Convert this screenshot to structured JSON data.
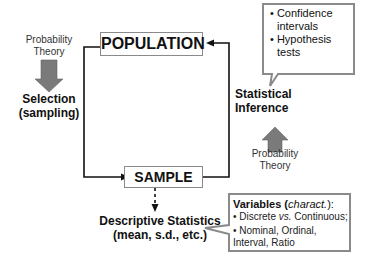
{
  "population": {
    "label": "POPULATION"
  },
  "sample": {
    "label": "SAMPLE"
  },
  "left": {
    "prob_line1": "Probability",
    "prob_line2": "Theory",
    "selection_line1": "Selection",
    "selection_line2": "(sampling)"
  },
  "right": {
    "inference_line1": "Statistical",
    "inference_line2": "Inference",
    "prob_line1": "Probability",
    "prob_line2": "Theory"
  },
  "callout_inference": {
    "items": [
      {
        "line1": "Confidence",
        "line2": "intervals"
      },
      {
        "line1": "Hypothesis",
        "line2": "tests"
      }
    ]
  },
  "descriptive": {
    "line1": "Descriptive Statistics",
    "line2": "(mean, s.d., etc.)"
  },
  "callout_variables": {
    "title_prefix": "Variables (",
    "title_italic": "charact.",
    "title_suffix": "):",
    "item1_a": "Discrete ",
    "item1_italic": "vs.",
    "item1_b": " Continuous;",
    "item2_line1": "Nominal, Ordinal,",
    "item2_line2": "Interval, Ratio"
  },
  "colors": {
    "arrow_gray": "#7a7a7a",
    "box_border": "#8a8a8a",
    "line": "#111111"
  }
}
